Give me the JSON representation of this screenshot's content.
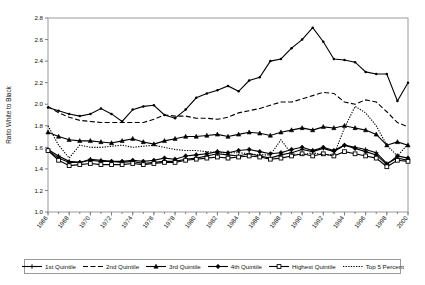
{
  "chart_data": {
    "type": "line",
    "title": "",
    "xlabel": "",
    "ylabel": "Ratio White to Black",
    "ylim": [
      1.0,
      2.8
    ],
    "ytick_step": 0.2,
    "yticks": [
      "1.0",
      "1.2",
      "1.4",
      "1.6",
      "1.8",
      "2.0",
      "2.2",
      "2.4",
      "2.6",
      "2.8"
    ],
    "xlim": [
      1966,
      2000
    ],
    "xtick_step": 2,
    "x": [
      1966,
      1967,
      1968,
      1969,
      1970,
      1971,
      1972,
      1973,
      1974,
      1975,
      1976,
      1977,
      1978,
      1979,
      1980,
      1981,
      1982,
      1983,
      1984,
      1985,
      1986,
      1987,
      1988,
      1989,
      1990,
      1991,
      1992,
      1993,
      1994,
      1995,
      1996,
      1997,
      1998,
      1999,
      2000
    ],
    "xticks": [
      "1966",
      "1968",
      "1970",
      "1972",
      "1974",
      "1976",
      "1978",
      "1980",
      "1982",
      "1984",
      "1986",
      "1988",
      "1990",
      "1992",
      "1994",
      "1996",
      "1998",
      "2000"
    ],
    "grid": false,
    "legend_position": "bottom",
    "series": [
      {
        "name": "1st Quintile",
        "style": "solid",
        "marker": "cross",
        "values": [
          1.58,
          1.52,
          1.47,
          1.46,
          1.49,
          1.48,
          1.47,
          1.46,
          1.47,
          1.45,
          1.46,
          1.47,
          1.47,
          1.49,
          1.5,
          1.52,
          1.54,
          1.53,
          1.52,
          1.54,
          1.52,
          1.5,
          1.53,
          1.55,
          1.58,
          1.56,
          1.59,
          1.56,
          1.62,
          1.6,
          1.58,
          1.55,
          1.45,
          1.5,
          1.48
        ]
      },
      {
        "name": "2nd Quintile",
        "style": "dashed",
        "marker": "none",
        "values": [
          1.98,
          1.92,
          1.88,
          1.85,
          1.84,
          1.83,
          1.83,
          1.83,
          1.83,
          1.83,
          1.86,
          1.9,
          1.89,
          1.89,
          1.87,
          1.87,
          1.86,
          1.88,
          1.92,
          1.94,
          1.96,
          1.99,
          2.02,
          2.02,
          2.05,
          2.08,
          2.11,
          2.1,
          2.02,
          2.0,
          2.04,
          2.02,
          1.93,
          1.83,
          1.79
        ]
      },
      {
        "name": "3rd Quintile",
        "style": "solid",
        "marker": "triangle",
        "values": [
          1.74,
          1.7,
          1.67,
          1.66,
          1.66,
          1.65,
          1.64,
          1.66,
          1.68,
          1.65,
          1.63,
          1.66,
          1.68,
          1.7,
          1.7,
          1.71,
          1.72,
          1.7,
          1.72,
          1.74,
          1.73,
          1.71,
          1.74,
          1.76,
          1.78,
          1.76,
          1.79,
          1.78,
          1.8,
          1.78,
          1.76,
          1.72,
          1.62,
          1.65,
          1.62
        ]
      },
      {
        "name": "4th Quintile",
        "style": "solid",
        "marker": "diamond",
        "values": [
          1.57,
          1.5,
          1.46,
          1.46,
          1.48,
          1.47,
          1.47,
          1.47,
          1.48,
          1.47,
          1.48,
          1.5,
          1.49,
          1.52,
          1.53,
          1.54,
          1.56,
          1.55,
          1.57,
          1.58,
          1.56,
          1.54,
          1.55,
          1.58,
          1.6,
          1.57,
          1.6,
          1.57,
          1.62,
          1.59,
          1.56,
          1.53,
          1.44,
          1.52,
          1.5
        ]
      },
      {
        "name": "Highest Quintile",
        "style": "solid",
        "marker": "square",
        "values": [
          1.57,
          1.48,
          1.43,
          1.44,
          1.45,
          1.44,
          1.44,
          1.44,
          1.45,
          1.44,
          1.45,
          1.46,
          1.46,
          1.48,
          1.49,
          1.5,
          1.51,
          1.5,
          1.51,
          1.52,
          1.51,
          1.49,
          1.5,
          1.52,
          1.54,
          1.52,
          1.54,
          1.52,
          1.56,
          1.54,
          1.52,
          1.5,
          1.42,
          1.48,
          1.47
        ]
      },
      {
        "name": "Top 5 Percent",
        "style": "dotted",
        "marker": "none",
        "values": [
          1.8,
          1.62,
          1.5,
          1.62,
          1.6,
          1.6,
          1.61,
          1.62,
          1.6,
          1.61,
          1.62,
          1.6,
          1.58,
          1.57,
          1.57,
          1.56,
          1.55,
          1.55,
          1.55,
          1.54,
          1.53,
          1.53,
          1.67,
          1.54,
          1.53,
          1.55,
          1.53,
          1.53,
          1.78,
          1.98,
          1.92,
          1.8,
          1.62,
          1.52,
          1.63
        ]
      },
      {
        "name": "Top Ratio Line",
        "style": "solid",
        "marker": "dot",
        "values": [
          1.97,
          1.94,
          1.91,
          1.89,
          1.91,
          1.96,
          1.91,
          1.84,
          1.95,
          1.98,
          1.99,
          1.9,
          1.87,
          1.95,
          2.06,
          2.1,
          2.13,
          2.17,
          2.12,
          2.22,
          2.25,
          2.4,
          2.42,
          2.52,
          2.6,
          2.71,
          2.58,
          2.42,
          2.41,
          2.39,
          2.3,
          2.28,
          2.28,
          2.03,
          2.2
        ]
      }
    ]
  },
  "legend": {
    "items": [
      {
        "label": "1st Quintile",
        "style": "solid",
        "marker": "cross"
      },
      {
        "label": "2nd Quintile",
        "style": "dashed",
        "marker": "none"
      },
      {
        "label": "3rd Quintile",
        "style": "solid",
        "marker": "triangle"
      },
      {
        "label": "4th Quintile",
        "style": "solid",
        "marker": "diamond"
      },
      {
        "label": "Highest Quintile",
        "style": "solid",
        "marker": "square"
      },
      {
        "label": "Top 5 Percent",
        "style": "dotted",
        "marker": "none"
      }
    ]
  }
}
